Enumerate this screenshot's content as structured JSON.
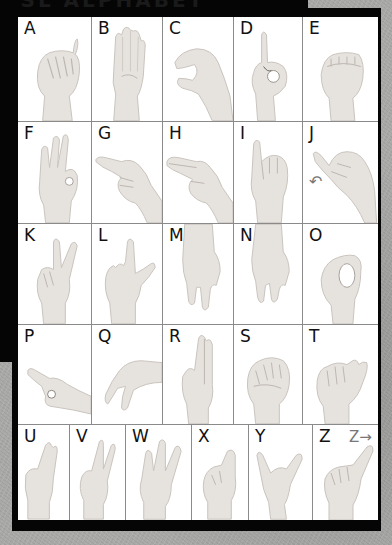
{
  "chart": {
    "title_partial": "ASL ALPHABET",
    "rows": [
      {
        "cells": [
          {
            "letter": "A"
          },
          {
            "letter": "B"
          },
          {
            "letter": "C"
          },
          {
            "letter": "D"
          },
          {
            "letter": "E"
          }
        ]
      },
      {
        "cells": [
          {
            "letter": "F"
          },
          {
            "letter": "G"
          },
          {
            "letter": "H"
          },
          {
            "letter": "I"
          },
          {
            "letter": "J",
            "motion": "↶"
          }
        ]
      },
      {
        "cells": [
          {
            "letter": "K"
          },
          {
            "letter": "L"
          },
          {
            "letter": "M"
          },
          {
            "letter": "N"
          },
          {
            "letter": "O"
          }
        ]
      },
      {
        "cells": [
          {
            "letter": "P"
          },
          {
            "letter": "Q"
          },
          {
            "letter": "R"
          },
          {
            "letter": "S"
          },
          {
            "letter": "T"
          }
        ]
      },
      {
        "cells": [
          {
            "letter": "U"
          },
          {
            "letter": "V"
          },
          {
            "letter": "W"
          },
          {
            "letter": "X"
          },
          {
            "letter": "Y"
          },
          {
            "letter": "Z",
            "motion": "Z→"
          }
        ]
      }
    ]
  },
  "colors": {
    "frame": "#050505",
    "panel": "#ffffff",
    "divider": "#8a8a8a",
    "letter": "#111111",
    "skin": "#e6e2de",
    "skin_shadow": "#c9c3bd",
    "background": "#a9a9a7"
  }
}
